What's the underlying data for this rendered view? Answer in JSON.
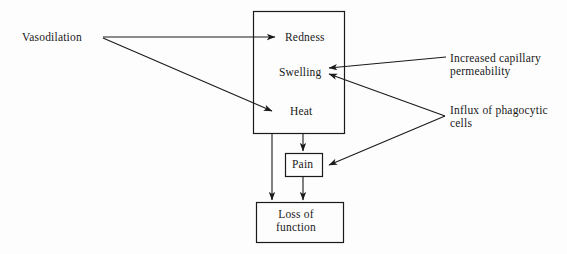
{
  "diagram": {
    "background_color": "#fdfdfd",
    "line_color": "#1a1a1a",
    "text_color": "#1a1a1a",
    "nodes": {
      "vasodilation": {
        "label": "Vasodilation",
        "shape": "text"
      },
      "cardinal_signs_box": {
        "shape": "rectangle"
      },
      "redness": {
        "label": "Redness",
        "shape": "text"
      },
      "swelling": {
        "label": "Swelling",
        "shape": "text"
      },
      "heat": {
        "label": "Heat",
        "shape": "text"
      },
      "pain": {
        "label": "Pain",
        "shape": "rectangle"
      },
      "loss_of_function": {
        "label": "Loss of\nfunction",
        "shape": "rectangle"
      },
      "increased_capillary_permeability": {
        "label": "Increased capillary\npermeability",
        "shape": "text"
      },
      "influx_of_phagocytic_cells": {
        "label": "Influx of phagocytic\ncells",
        "shape": "text"
      }
    },
    "edges": [
      {
        "from": "vasodilation",
        "to": "redness",
        "style": "arrow"
      },
      {
        "from": "vasodilation",
        "to": "heat",
        "style": "arrow"
      },
      {
        "from": "increased_capillary_permeability",
        "to": "swelling",
        "style": "arrow"
      },
      {
        "from": "influx_of_phagocytic_cells",
        "to": "swelling",
        "style": "arrow"
      },
      {
        "from": "influx_of_phagocytic_cells",
        "to": "pain",
        "style": "arrow"
      },
      {
        "from": "cardinal_signs_box",
        "to": "pain",
        "style": "arrow"
      },
      {
        "from": "cardinal_signs_box",
        "to": "loss_of_function",
        "style": "arrow"
      },
      {
        "from": "pain",
        "to": "loss_of_function",
        "style": "arrow"
      }
    ]
  }
}
